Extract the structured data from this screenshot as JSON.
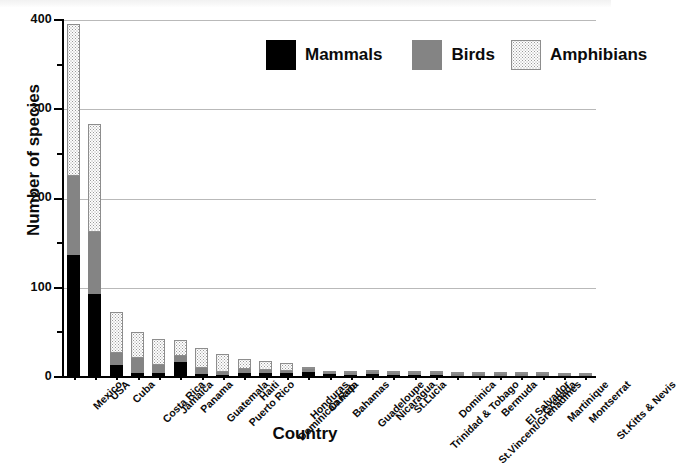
{
  "chart_data": {
    "type": "bar",
    "stacked": true,
    "title": "",
    "xlabel": "Country",
    "ylabel": "Number of species",
    "ylim": [
      0,
      400
    ],
    "yticks": [
      0,
      100,
      200,
      300,
      400
    ],
    "yticks_minor": [
      50,
      150,
      250,
      350
    ],
    "grid": "horizontal-major",
    "legend_position": "top-center",
    "categories": [
      "Mexico",
      "USA",
      "Cuba",
      "Costa Rica",
      "Jamaica",
      "Panama",
      "Guatemala",
      "Puerto Rico",
      "Haiti",
      "Dominican Rep.",
      "Honduras",
      "Canada",
      "Bahamas",
      "Guadeloupe",
      "Nicaragua",
      "St.Lucia",
      "Trinidad & Tobago",
      "Dominica",
      "St.Vincent/Grenadines",
      "Bermuda",
      "El Salvador",
      "Grenada",
      "Martinique",
      "Montserrat",
      "St.Kitts & Nevis"
    ],
    "series": [
      {
        "name": "Mammals",
        "color": "#000000",
        "values": [
          137,
          93,
          13,
          5,
          4,
          17,
          3,
          2,
          4,
          4,
          4,
          6,
          3,
          2,
          3,
          2,
          2,
          2,
          1,
          1,
          1,
          1,
          1,
          1,
          1
        ]
      },
      {
        "name": "Birds",
        "color": "#848484",
        "values": [
          88,
          69,
          14,
          16,
          9,
          7,
          7,
          4,
          5,
          4,
          3,
          3,
          2,
          2,
          3,
          2,
          3,
          2,
          2,
          2,
          2,
          2,
          2,
          1,
          1
        ]
      },
      {
        "name": "Amphibians",
        "color": "#f2f2f2",
        "pattern": "dotted",
        "values": [
          170,
          121,
          46,
          29,
          30,
          18,
          23,
          20,
          11,
          10,
          9,
          1,
          1,
          2,
          1,
          1,
          1,
          1,
          1,
          1,
          1,
          1,
          1,
          1,
          1
        ]
      }
    ],
    "totals": [
      395,
      283,
      73,
      50,
      43,
      42,
      33,
      26,
      20,
      18,
      16,
      10,
      6,
      6,
      7,
      5,
      6,
      5,
      4,
      4,
      4,
      4,
      4,
      3,
      3
    ]
  },
  "legend": {
    "items": [
      {
        "label": "Mammals",
        "swatch": "solid-black"
      },
      {
        "label": "Birds",
        "swatch": "solid-gray"
      },
      {
        "label": "Amphibians",
        "swatch": "dotted"
      }
    ]
  },
  "axes": {
    "y_title": "Number of species",
    "x_title": "Country",
    "y_tick_labels": [
      "400",
      "300",
      "200",
      "100",
      "0"
    ]
  }
}
